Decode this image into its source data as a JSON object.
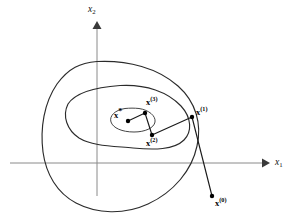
{
  "figure": {
    "type": "optimization-contour-diagram",
    "background_color": "#ffffff",
    "line_color": "#2b2b2b",
    "axis_color": "#8a8a8a"
  },
  "axes": {
    "x_label": "x",
    "x_subscript": "1",
    "y_label": "x",
    "y_subscript": "2",
    "origin": {
      "x": 97,
      "y": 163
    },
    "horizontal": {
      "x1": 10,
      "y1": 163,
      "x2": 262,
      "y2": 163
    },
    "vertical": {
      "x1": 97,
      "y1": 196,
      "x2": 97,
      "y2": 27
    }
  },
  "points": [
    {
      "id": "x-star",
      "label": "x",
      "superscript": "*",
      "x": 128,
      "y": 121,
      "label_x": 114,
      "label_y": 111
    },
    {
      "id": "x3",
      "label": "x",
      "superscript": "(3)",
      "x": 145,
      "y": 113,
      "label_x": 146,
      "label_y": 98
    },
    {
      "id": "x2",
      "label": "x",
      "superscript": "(2)",
      "x": 152,
      "y": 135,
      "label_x": 146,
      "label_y": 139
    },
    {
      "id": "x1",
      "label": "x",
      "superscript": "(1)",
      "x": 192,
      "y": 117,
      "label_x": 196,
      "label_y": 108
    },
    {
      "id": "x0",
      "label": "x",
      "superscript": "(0)",
      "x": 212,
      "y": 196,
      "label_x": 215,
      "label_y": 199
    }
  ],
  "path_segments": [
    {
      "from": "x0",
      "to": "x1"
    },
    {
      "from": "x1",
      "to": "x2"
    },
    {
      "from": "x2",
      "to": "x3"
    },
    {
      "from": "x3",
      "to": "x-star"
    }
  ],
  "contours": [
    {
      "id": "outer-contour",
      "path": "M 97,61.5 C 128,60 158,68 178,86 C 196,102 202,124 197,146 C 192,170 174,192 148,204 C 124,215 97,214 76,203 C 57,193 46,174 43,152 C 40,128 44,103 57,84 C 69,68 80,63 97,61.5 Z"
    },
    {
      "id": "middle-contour",
      "path": "M 120,85.5 C 146,84 168,92 181,106 C 192,118 192,132 184,140 C 174,150 154,150 133,148 C 112,146 92,146 79,138 C 67,130 62,116 68,104 C 76,92 98,87 120,85.5 Z"
    },
    {
      "id": "inner-contour",
      "path": "M 139,108.5 C 149,110 156,116 155,122 C 154,128 145,132 134,132 C 122,132 113,128 111,122 C 109,116 115,110 125,108.5 C 130,108 134,108 139,108.5 Z"
    }
  ]
}
